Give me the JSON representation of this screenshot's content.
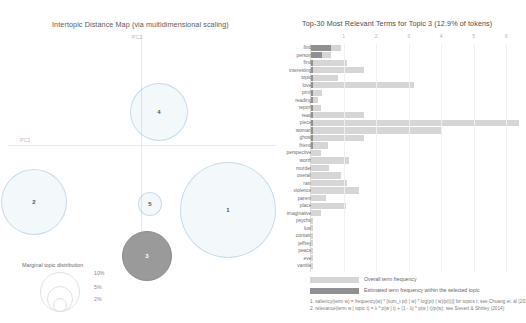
{
  "mds": {
    "title": "Intertopic Distance Map (via multidimensional scaling)",
    "axis_x_label": "PC1",
    "axis_y_label": "PC2",
    "topics": [
      {
        "id": "1",
        "label": "1",
        "x": 228,
        "y": 178,
        "r": 48,
        "selected": false
      },
      {
        "id": "2",
        "label": "2",
        "x": 34,
        "y": 170,
        "r": 33,
        "selected": false
      },
      {
        "id": "3",
        "label": "3",
        "x": 147,
        "y": 224,
        "r": 25,
        "selected": true
      },
      {
        "id": "4",
        "label": "4",
        "x": 159,
        "y": 80,
        "r": 29,
        "selected": false
      },
      {
        "id": "5",
        "label": "5",
        "x": 150,
        "y": 172,
        "r": 12,
        "selected": false
      }
    ],
    "marginal_legend": {
      "title": "Marginal topic distribution",
      "items": [
        {
          "label": "2%",
          "r": 7
        },
        {
          "label": "5%",
          "r": 13
        },
        {
          "label": "10%",
          "r": 20
        }
      ]
    }
  },
  "bars": {
    "title": "Top-30 Most Relevant Terms for Topic 3 (12.9% of tokens)",
    "legend": {
      "overall_label": "Overall term frequency",
      "topic_label": "Estimated term frequency within the selected topic"
    },
    "footnotes": [
      "1. saliency(term w) = frequency(w) * [sum_t p(t | w) * log(p(t | w)/p(t))] for topics t; see Chuang et. al (2012)",
      "2. relevance(term w | topic t) = λ * p(w | t) + (1 - λ) * p(w | t)/p(w); see Sievert & Shirley (2014)"
    ]
  },
  "chart_data": {
    "type": "bar",
    "title": "Top-30 Most Relevant Terms for Topic 3 (12.9% of tokens)",
    "xlabel": "",
    "ylabel": "",
    "xlim": [
      0,
      6.55
    ],
    "xticks": [
      1,
      2,
      3,
      4,
      5,
      6
    ],
    "grid": true,
    "orientation": "horizontal",
    "legend_position": "bottom-left",
    "categories": [
      "find",
      "person",
      "find",
      "interesting",
      "topic",
      "love",
      "print",
      "reading",
      "report",
      "read",
      "piece",
      "woman",
      "ghost",
      "friend",
      "perspective",
      "worth",
      "murder",
      "overall",
      "rain",
      "violence",
      "parent",
      "place",
      "imaginative",
      "psycho",
      "lust",
      "contain",
      "jeffrey",
      "peace",
      "eve",
      "vanitie"
    ],
    "series": [
      {
        "name": "Overall term frequency",
        "values": [
          0.93,
          0.62,
          1.1,
          1.62,
          0.83,
          3.17,
          0.35,
          0.23,
          0.3,
          1.62,
          6.4,
          4.02,
          1.62,
          0.52,
          0.3,
          1.17,
          0.55,
          0.93,
          1.11,
          1.48,
          0.45,
          1.07,
          0.32,
          0.05,
          0.05,
          0.05,
          0.05,
          0.05,
          0.05,
          0.05
        ]
      },
      {
        "name": "Estimated term frequency within the selected topic",
        "values": [
          0.62,
          0.33,
          0.07,
          0.07,
          0.07,
          0.07,
          0.07,
          0.07,
          0.07,
          0.07,
          0.07,
          0.07,
          0.07,
          0.05,
          0.0,
          0.0,
          0.0,
          0.0,
          0.0,
          0.0,
          0.0,
          0.0,
          0.0,
          0.0,
          0.0,
          0.0,
          0.0,
          0.0,
          0.0,
          0.0
        ]
      }
    ]
  }
}
